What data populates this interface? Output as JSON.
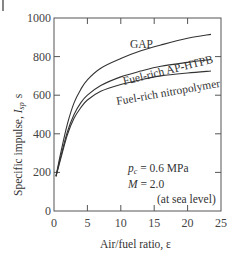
{
  "chart_data": {
    "type": "line",
    "title": "",
    "xlabel": "Air/fuel ratio,  ε",
    "ylabel": "Specific impulse,  I_sp  s",
    "ylabel_main": "Specific impulse, ",
    "ylabel_symbol": "I",
    "ylabel_sub": "sp",
    "ylabel_unit": "s",
    "xlim": [
      0,
      25
    ],
    "ylim": [
      0,
      1000
    ],
    "xticks": [
      0,
      5,
      10,
      15,
      20,
      25
    ],
    "yticks": [
      0,
      200,
      400,
      600,
      800,
      1000
    ],
    "grid": false,
    "legend_position": "inline labels",
    "series": [
      {
        "name": "GAP",
        "x": [
          0.3,
          1,
          2,
          3,
          4,
          5,
          7,
          10,
          13,
          16,
          20,
          23.5
        ],
        "values": [
          180,
          300,
          450,
          560,
          630,
          680,
          740,
          790,
          830,
          860,
          895,
          915
        ]
      },
      {
        "name": "Fuel-rich  AP-HTPB",
        "x": [
          0.3,
          1,
          2,
          3,
          4,
          5,
          7,
          10,
          13,
          16,
          20,
          23.5
        ],
        "values": [
          180,
          280,
          410,
          500,
          560,
          600,
          650,
          695,
          725,
          750,
          770,
          785
        ]
      },
      {
        "name": "Fuel-rich  nitropolymer",
        "x": [
          0.3,
          1,
          2,
          3,
          4,
          5,
          7,
          10,
          13,
          16,
          20,
          23.5
        ],
        "values": [
          180,
          270,
          395,
          480,
          535,
          575,
          620,
          655,
          680,
          700,
          715,
          725
        ]
      }
    ],
    "annotations": [
      {
        "text_var": "p",
        "text_sub": "c",
        "text_rest": " = 0.6 MPa"
      },
      {
        "text_var": "M",
        "text_rest": " = 2.0"
      },
      {
        "text": "(at  sea  level)"
      }
    ]
  }
}
